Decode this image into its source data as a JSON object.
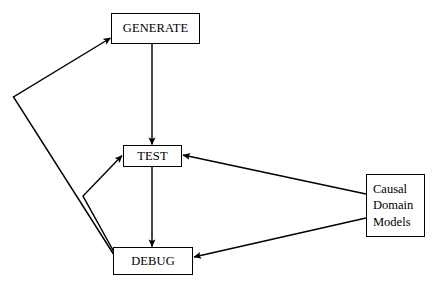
{
  "diagram": {
    "background_color": "#ffffff",
    "line_color": "#000000",
    "text_color": "#000000",
    "nodes": [
      {
        "id": "generate",
        "label": "GENERATE"
      },
      {
        "id": "test",
        "label": "TEST"
      },
      {
        "id": "debug",
        "label": "DEBUG"
      },
      {
        "id": "causal",
        "label": "Causal\nDomain\nModels"
      }
    ],
    "edges": [
      {
        "id": "generate-to-test",
        "from": "GENERATE",
        "to": "TEST",
        "style": "straight-vertical",
        "arrow": "to"
      },
      {
        "id": "test-to-debug",
        "from": "TEST",
        "to": "DEBUG",
        "style": "straight-vertical",
        "arrow": "to"
      },
      {
        "id": "debug-to-generate",
        "from": "DEBUG",
        "to": "GENERATE",
        "style": "polyline-left",
        "arrow": "to"
      },
      {
        "id": "debug-to-test",
        "from": "DEBUG",
        "to": "TEST",
        "style": "polyline-left",
        "arrow": "to"
      },
      {
        "id": "causal-to-test",
        "from": "Causal Domain Models",
        "to": "TEST",
        "style": "diagonal",
        "arrow": "to"
      },
      {
        "id": "causal-to-debug",
        "from": "Causal Domain Models",
        "to": "DEBUG",
        "style": "diagonal",
        "arrow": "to"
      }
    ]
  }
}
